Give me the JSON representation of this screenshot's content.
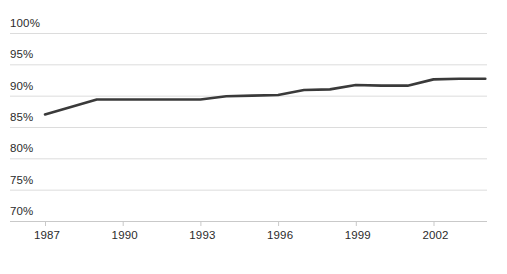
{
  "chart_data": {
    "type": "line",
    "title": "",
    "subtitle": "",
    "xlabel": "",
    "ylabel": "",
    "grid": true,
    "legend": false,
    "line_color": "#3a3a3a",
    "grid_color": "#dcdcdc",
    "axis_color": "#c9c9c9",
    "background": "#ffffff",
    "ylim": [
      70,
      100
    ],
    "ytick_labels": [
      "100%",
      "95%",
      "90%",
      "85%",
      "80%",
      "75%",
      "70%"
    ],
    "ytick_values": [
      100,
      95,
      90,
      85,
      80,
      75,
      70
    ],
    "xlim": [
      1987,
      2004
    ],
    "xtick_labels": [
      "1987",
      "1990",
      "1993",
      "1996",
      "1999",
      "2002"
    ],
    "xtick_values": [
      1987,
      1990,
      1993,
      1996,
      1999,
      2002
    ],
    "x": [
      1987,
      1988,
      1989,
      1990,
      1991,
      1992,
      1993,
      1994,
      1995,
      1996,
      1997,
      1998,
      1999,
      2000,
      2001,
      2002,
      2003,
      2004
    ],
    "values": [
      87.0,
      88.2,
      89.4,
      89.4,
      89.4,
      89.4,
      89.4,
      89.9,
      90.0,
      90.1,
      90.9,
      91.0,
      91.7,
      91.6,
      91.6,
      92.6,
      92.7,
      92.7
    ],
    "series": [
      {
        "name": "",
        "values": [
          87.0,
          88.2,
          89.4,
          89.4,
          89.4,
          89.4,
          89.4,
          89.9,
          90.0,
          90.1,
          90.9,
          91.0,
          91.7,
          91.6,
          91.6,
          92.6,
          92.7,
          92.7
        ]
      }
    ]
  }
}
